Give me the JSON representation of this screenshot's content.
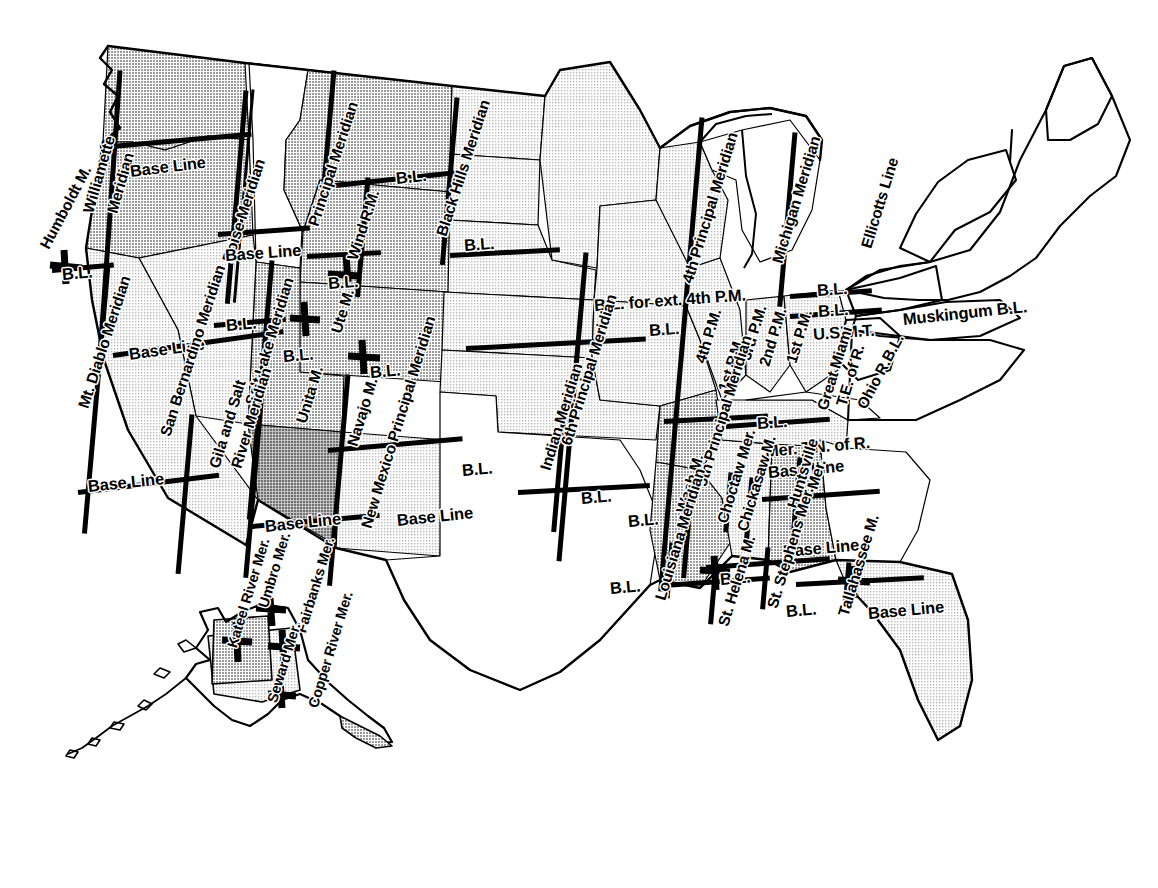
{
  "map": {
    "title": "Principal Meridians and Base Lines of the United States Public Land Survey System",
    "subject": "Principal Meridians and Base Lines",
    "region": "United States including Alaska",
    "colors": {
      "outline": "#000000",
      "survey_line": "#000000",
      "fill_light": "#e6e6e6",
      "fill_medium": "#c9c9c9",
      "fill_dark": "#a8a8a8",
      "background": "#ffffff"
    },
    "style": "black-and-white line map with halftone gray fills"
  },
  "labels": [
    {
      "id": "humboldt-m",
      "text": "Humboldt M.",
      "x": 44,
      "y": 240,
      "rot": -62,
      "size": "s15"
    },
    {
      "id": "willamette-meridian",
      "text": "Williamette",
      "x": 88,
      "y": 205,
      "rot": -74,
      "size": "s15"
    },
    {
      "id": "willamette-meridian-2",
      "text": "Meridian",
      "x": 112,
      "y": 205,
      "rot": -74,
      "size": "s15"
    },
    {
      "id": "base-line-wa",
      "text": "Base Line",
      "x": 130,
      "y": 163,
      "rot": -7,
      "size": "s16"
    },
    {
      "id": "boise-meridian",
      "text": "Boise Meridian",
      "x": 227,
      "y": 254,
      "rot": -72,
      "size": "s15"
    },
    {
      "id": "base-line-id",
      "text": "Base Line",
      "x": 225,
      "y": 247,
      "rot": -4,
      "size": "s16"
    },
    {
      "id": "principal-meridian-mt",
      "text": "Principal Meridian",
      "x": 313,
      "y": 218,
      "rot": -72,
      "size": "s15"
    },
    {
      "id": "wind-rm",
      "text": "Wind R.M.",
      "x": 352,
      "y": 252,
      "rot": -72,
      "size": "s15"
    },
    {
      "id": "bl-mt-north",
      "text": "B.L.",
      "x": 396,
      "y": 170,
      "rot": -6,
      "size": "s16"
    },
    {
      "id": "black-hills-meridian",
      "text": "Black Hills Meridian",
      "x": 441,
      "y": 228,
      "rot": -72,
      "size": "s15"
    },
    {
      "id": "bl-sd",
      "text": "B.L.",
      "x": 464,
      "y": 237,
      "rot": -4,
      "size": "s16"
    },
    {
      "id": "bl-wy",
      "text": "B.L.",
      "x": 328,
      "y": 275,
      "rot": -4,
      "size": "s16"
    },
    {
      "id": "fourth-principal-meridian",
      "text": "4th Principal Meridian",
      "x": 687,
      "y": 275,
      "rot": -73,
      "size": "s15"
    },
    {
      "id": "michigan-meridian",
      "text": "Michigan Meridian",
      "x": 777,
      "y": 255,
      "rot": -73,
      "size": "s15"
    },
    {
      "id": "ellicotts-line",
      "text": "Ellicotts Line",
      "x": 866,
      "y": 240,
      "rot": -73,
      "size": "s15"
    },
    {
      "id": "bl-for-ext-4th-pm",
      "text": "B.L. for ext. 4th P.M.",
      "x": 594,
      "y": 297,
      "rot": -4,
      "size": "s16"
    },
    {
      "id": "bl-ia",
      "text": "B.L.",
      "x": 649,
      "y": 322,
      "rot": -4,
      "size": "s16"
    },
    {
      "id": "bl-mi-1",
      "text": "B.L.",
      "x": 817,
      "y": 282,
      "rot": -4,
      "size": "s16"
    },
    {
      "id": "bl-mi-2",
      "text": "B.L.",
      "x": 818,
      "y": 303,
      "rot": -4,
      "size": "s16"
    },
    {
      "id": "usmt",
      "text": "U.S.M.T.",
      "x": 813,
      "y": 326,
      "rot": -4,
      "size": "s16"
    },
    {
      "id": "muskingum-bl",
      "text": "Muskingum B.L.",
      "x": 903,
      "y": 311,
      "rot": -6,
      "size": "s16"
    },
    {
      "id": "fourth-pm",
      "text": "4th P.M.",
      "x": 700,
      "y": 355,
      "rot": -73,
      "size": "s15"
    },
    {
      "id": "third-pm",
      "text": "3rd P.M.",
      "x": 745,
      "y": 352,
      "rot": -73,
      "size": "s15"
    },
    {
      "id": "second-pm",
      "text": "2nd P.M.",
      "x": 764,
      "y": 358,
      "rot": -73,
      "size": "s15"
    },
    {
      "id": "first-pm",
      "text": "1st P.M.",
      "x": 791,
      "y": 355,
      "rot": -73,
      "size": "s15"
    },
    {
      "id": "first-pm-2",
      "text": "1st P.M.",
      "x": 723,
      "y": 383,
      "rot": -73,
      "size": "s15"
    },
    {
      "id": "great-miami",
      "text": "Great Miami",
      "x": 822,
      "y": 402,
      "rot": -73,
      "size": "s15"
    },
    {
      "id": "te-of-r",
      "text": "T.E. of R.",
      "x": 841,
      "y": 398,
      "rot": -73,
      "size": "s15"
    },
    {
      "id": "ohio-rbl",
      "text": "Ohio R.B.L.",
      "x": 861,
      "y": 400,
      "rot": -62,
      "size": "s15"
    },
    {
      "id": "bl-in",
      "text": "B.L.",
      "x": 757,
      "y": 415,
      "rot": -4,
      "size": "s16"
    },
    {
      "id": "mer-tn-of-r",
      "text": "Mer. T.N. of R.",
      "x": 765,
      "y": 443,
      "rot": -5,
      "size": "s16"
    },
    {
      "id": "base-line-al",
      "text": "Base Line",
      "x": 768,
      "y": 464,
      "rot": -5,
      "size": "s16"
    },
    {
      "id": "mt-diablo-meridian",
      "text": "Mt. Diablo Meridian",
      "x": 83,
      "y": 400,
      "rot": -72,
      "size": "s15"
    },
    {
      "id": "bl-ca-north",
      "text": "B.L.",
      "x": 62,
      "y": 266,
      "rot": -5,
      "size": "s16"
    },
    {
      "id": "base-line-nv",
      "text": "Base Line",
      "x": 129,
      "y": 346,
      "rot": -8,
      "size": "s16"
    },
    {
      "id": "bl-ut-west",
      "text": "B.L.",
      "x": 226,
      "y": 317,
      "rot": -5,
      "size": "s16"
    },
    {
      "id": "salt-lake-meridian",
      "text": "Salt Lake Meridian",
      "x": 250,
      "y": 397,
      "rot": -73,
      "size": "s15"
    },
    {
      "id": "bl-ut",
      "text": "B.L.",
      "x": 283,
      "y": 348,
      "rot": -5,
      "size": "s16"
    },
    {
      "id": "unita-m",
      "text": "Unita M.",
      "x": 301,
      "y": 415,
      "rot": -73,
      "size": "s15"
    },
    {
      "id": "ute-m",
      "text": "Ute M.",
      "x": 336,
      "y": 325,
      "rot": -73,
      "size": "s15"
    },
    {
      "id": "bl-co",
      "text": "B.L.",
      "x": 370,
      "y": 364,
      "rot": -5,
      "size": "s16"
    },
    {
      "id": "navajo-m",
      "text": "Navajo M.",
      "x": 352,
      "y": 438,
      "rot": -73,
      "size": "s15"
    },
    {
      "id": "san-bernardino-meridian",
      "text": "San Bernardino Meridian",
      "x": 165,
      "y": 428,
      "rot": -72,
      "size": "s15"
    },
    {
      "id": "base-line-ca",
      "text": "Base Line",
      "x": 88,
      "y": 478,
      "rot": -6,
      "size": "s16"
    },
    {
      "id": "gila-and-salt",
      "text": "Gila and Salt",
      "x": 214,
      "y": 460,
      "rot": -73,
      "size": "s15"
    },
    {
      "id": "river-meridian",
      "text": "River Meridian",
      "x": 236,
      "y": 460,
      "rot": -73,
      "size": "s15"
    },
    {
      "id": "base-line-az",
      "text": "Base Line",
      "x": 265,
      "y": 518,
      "rot": -6,
      "size": "s16"
    },
    {
      "id": "new-mexico-principal-meridian",
      "text": "New Mexico Principal Meridian",
      "x": 366,
      "y": 520,
      "rot": -73,
      "size": "s15"
    },
    {
      "id": "base-line-nm",
      "text": "Base Line",
      "x": 397,
      "y": 512,
      "rot": -6,
      "size": "s16"
    },
    {
      "id": "bl-nm-east",
      "text": "B.L.",
      "x": 462,
      "y": 462,
      "rot": -5,
      "size": "s16"
    },
    {
      "id": "indian-meridian",
      "text": "Indian Meridian",
      "x": 545,
      "y": 462,
      "rot": -73,
      "size": "s15"
    },
    {
      "id": "sixth-principal-meridian",
      "text": "6th Principal Meridian",
      "x": 566,
      "y": 437,
      "rot": -73,
      "size": "s15"
    },
    {
      "id": "bl-ok",
      "text": "B.L.",
      "x": 581,
      "y": 490,
      "rot": -5,
      "size": "s16"
    },
    {
      "id": "bl-ok-south",
      "text": "B.L.",
      "x": 628,
      "y": 513,
      "rot": -5,
      "size": "s16"
    },
    {
      "id": "bl-tx",
      "text": "B.L.",
      "x": 610,
      "y": 580,
      "rot": -5,
      "size": "s16"
    },
    {
      "id": "wash-m",
      "text": "Wash M.",
      "x": 681,
      "y": 505,
      "rot": -73,
      "size": "s15"
    },
    {
      "id": "fifth-principal-meridian",
      "text": "5th Principal Meridian",
      "x": 701,
      "y": 478,
      "rot": -73,
      "size": "s15"
    },
    {
      "id": "louisiana-meridian",
      "text": "Louisiana Meridian",
      "x": 660,
      "y": 592,
      "rot": -73,
      "size": "s15"
    },
    {
      "id": "choctaw-mer",
      "text": "Choctaw Mer.",
      "x": 722,
      "y": 515,
      "rot": -73,
      "size": "s15"
    },
    {
      "id": "chickasaw-m",
      "text": "Chickasaw M.",
      "x": 742,
      "y": 523,
      "rot": -73,
      "size": "s15"
    },
    {
      "id": "huntsville",
      "text": "Huntsville",
      "x": 792,
      "y": 500,
      "rot": -73,
      "size": "s15"
    },
    {
      "id": "huntsville-mer",
      "text": "Mer.",
      "x": 812,
      "y": 481,
      "rot": -73,
      "size": "s15"
    },
    {
      "id": "base-line-ms",
      "text": "Base Line",
      "x": 783,
      "y": 543,
      "rot": -5,
      "size": "s16"
    },
    {
      "id": "bl-la",
      "text": "B.L.",
      "x": 720,
      "y": 571,
      "rot": -5,
      "size": "s16"
    },
    {
      "id": "bl-fl-west",
      "text": "B.L.",
      "x": 786,
      "y": 603,
      "rot": -5,
      "size": "s16"
    },
    {
      "id": "st-helena-m",
      "text": "St. Helena M.",
      "x": 723,
      "y": 618,
      "rot": -73,
      "size": "s15"
    },
    {
      "id": "st-stephens-mer",
      "text": "St. Stephens Mer.",
      "x": 772,
      "y": 600,
      "rot": -73,
      "size": "s15"
    },
    {
      "id": "tallahassee-m",
      "text": "Tallahassee M.",
      "x": 843,
      "y": 608,
      "rot": -73,
      "size": "s15"
    },
    {
      "id": "base-line-fl",
      "text": "Base Line",
      "x": 868,
      "y": 605,
      "rot": -5,
      "size": "s16"
    },
    {
      "id": "kateel-river-mer",
      "text": "Kateel River Mer.",
      "x": 232,
      "y": 640,
      "rot": -73,
      "size": "s14"
    },
    {
      "id": "umbro-mer",
      "text": "Umbro Mer.",
      "x": 263,
      "y": 600,
      "rot": -73,
      "size": "s14"
    },
    {
      "id": "fairbanks-mer",
      "text": "Fairbanks Mer.",
      "x": 301,
      "y": 625,
      "rot": -73,
      "size": "s14"
    },
    {
      "id": "seward-mer",
      "text": "Seward Mer.",
      "x": 272,
      "y": 695,
      "rot": -73,
      "size": "s14"
    },
    {
      "id": "copper-river-mer",
      "text": "Copper River Mer.",
      "x": 313,
      "y": 700,
      "rot": -73,
      "size": "s14"
    }
  ],
  "survey_lines": [
    {
      "id": "wa-base-line",
      "x": 100,
      "y": 145,
      "len": 152,
      "rot": -5,
      "w": 5
    },
    {
      "id": "or-base-line",
      "x": 218,
      "y": 232,
      "len": 92,
      "rot": -4,
      "w": 5
    },
    {
      "id": "willamette-mer",
      "x": 120,
      "y": 68,
      "len": 300,
      "rot": 94,
      "w": 5
    },
    {
      "id": "boise-mer",
      "x": 246,
      "y": 88,
      "len": 214,
      "rot": 95,
      "w": 5
    },
    {
      "id": "boise-mer-2",
      "x": 253,
      "y": 88,
      "len": 214,
      "rot": 95,
      "w": 3
    },
    {
      "id": "mt-diablo-mer",
      "x": 108,
      "y": 262,
      "len": 270,
      "rot": 95,
      "w": 5
    },
    {
      "id": "ca-bl-north",
      "x": 52,
      "y": 268,
      "len": 62,
      "rot": -5,
      "w": 5
    },
    {
      "id": "nv-base-line",
      "x": 113,
      "y": 353,
      "len": 172,
      "rot": -8,
      "w": 5
    },
    {
      "id": "san-bernardino",
      "x": 192,
      "y": 412,
      "len": 160,
      "rot": 95,
      "w": 5
    },
    {
      "id": "ca-bl-south",
      "x": 78,
      "y": 490,
      "len": 142,
      "rot": -7,
      "w": 5
    },
    {
      "id": "salt-lake-mer",
      "x": 272,
      "y": 258,
      "len": 260,
      "rot": 95,
      "w": 5
    },
    {
      "id": "ut-base-line",
      "x": 214,
      "y": 323,
      "len": 72,
      "rot": -5,
      "w": 5
    },
    {
      "id": "gila-salt-mer",
      "x": 263,
      "y": 378,
      "len": 198,
      "rot": 95,
      "w": 5
    },
    {
      "id": "az-base-line",
      "x": 252,
      "y": 524,
      "len": 128,
      "rot": -5,
      "w": 5
    },
    {
      "id": "nm-principal-mer",
      "x": 348,
      "y": 372,
      "len": 212,
      "rot": 95,
      "w": 5
    },
    {
      "id": "nm-base-line",
      "x": 328,
      "y": 448,
      "len": 135,
      "rot": -5,
      "w": 5
    },
    {
      "id": "principal-mer-mt",
      "x": 334,
      "y": 68,
      "len": 130,
      "rot": 95,
      "w": 5
    },
    {
      "id": "mt-bl",
      "x": 335,
      "y": 183,
      "len": 126,
      "rot": -6,
      "w": 5
    },
    {
      "id": "wind-rm",
      "x": 368,
      "y": 175,
      "len": 120,
      "rot": 95,
      "w": 5
    },
    {
      "id": "wy-bl",
      "x": 307,
      "y": 254,
      "len": 74,
      "rot": -3,
      "w": 5
    },
    {
      "id": "black-hills-mer",
      "x": 457,
      "y": 95,
      "len": 168,
      "rot": 95,
      "w": 5
    },
    {
      "id": "sd-bl",
      "x": 450,
      "y": 253,
      "len": 110,
      "rot": -3,
      "w": 5
    },
    {
      "id": "sixth-principal",
      "x": 586,
      "y": 250,
      "len": 310,
      "rot": 95,
      "w": 5
    },
    {
      "id": "ks-bl",
      "x": 466,
      "y": 346,
      "len": 180,
      "rot": -3,
      "w": 5
    },
    {
      "id": "indian-mer",
      "x": 565,
      "y": 400,
      "len": 130,
      "rot": 95,
      "w": 5
    },
    {
      "id": "ok-bl",
      "x": 518,
      "y": 490,
      "len": 132,
      "rot": -3,
      "w": 5
    },
    {
      "id": "fifth-principal",
      "x": 686,
      "y": 300,
      "len": 290,
      "rot": 95,
      "w": 5
    },
    {
      "id": "ar-bl",
      "x": 664,
      "y": 419,
      "len": 104,
      "rot": -3,
      "w": 5
    },
    {
      "id": "fourth-principal",
      "x": 702,
      "y": 115,
      "len": 190,
      "rot": 95,
      "w": 5
    },
    {
      "id": "mi-mer",
      "x": 795,
      "y": 130,
      "len": 175,
      "rot": 95,
      "w": 5
    },
    {
      "id": "mi-bl",
      "x": 790,
      "y": 294,
      "len": 82,
      "rot": -4,
      "w": 5
    },
    {
      "id": "mi-bl-2",
      "x": 790,
      "y": 314,
      "len": 92,
      "rot": -4,
      "w": 5
    },
    {
      "id": "in-bl",
      "x": 726,
      "y": 424,
      "len": 104,
      "rot": -4,
      "w": 5
    },
    {
      "id": "louisiana-mer",
      "x": 672,
      "y": 540,
      "len": 56,
      "rot": 95,
      "w": 5
    },
    {
      "id": "la-bl",
      "x": 664,
      "y": 583,
      "len": 106,
      "rot": -4,
      "w": 5
    },
    {
      "id": "st-helena-mer",
      "x": 716,
      "y": 560,
      "len": 62,
      "rot": 95,
      "w": 5
    },
    {
      "id": "wash-mer",
      "x": 692,
      "y": 480,
      "len": 96,
      "rot": 95,
      "w": 5
    },
    {
      "id": "choctaw-mer",
      "x": 731,
      "y": 470,
      "len": 60,
      "rot": 95,
      "w": 5
    },
    {
      "id": "chickasaw-mer",
      "x": 752,
      "y": 475,
      "len": 62,
      "rot": 95,
      "w": 5
    },
    {
      "id": "ms-bl",
      "x": 706,
      "y": 565,
      "len": 124,
      "rot": -4,
      "w": 5
    },
    {
      "id": "st-stephens-mer",
      "x": 768,
      "y": 545,
      "len": 62,
      "rot": 95,
      "w": 5
    },
    {
      "id": "huntsville-mer",
      "x": 800,
      "y": 455,
      "len": 90,
      "rot": 95,
      "w": 5
    },
    {
      "id": "al-bl",
      "x": 762,
      "y": 497,
      "len": 118,
      "rot": -4,
      "w": 5
    },
    {
      "id": "tallahassee-mer",
      "x": 849,
      "y": 560,
      "len": 44,
      "rot": 95,
      "w": 5
    },
    {
      "id": "fl-bl",
      "x": 796,
      "y": 582,
      "len": 128,
      "rot": -3,
      "w": 5
    }
  ],
  "legend_note": "Each heavy straight line marks a principal meridian (north-south) or base line (east-west) of the U.S. rectangular survey system."
}
